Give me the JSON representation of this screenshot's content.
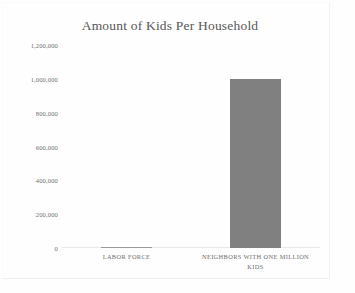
{
  "chart_data": {
    "type": "bar",
    "title": "Amount of Kids Per Household",
    "xlabel": "",
    "ylabel": "",
    "categories": [
      "LABOR FORCE",
      "NEIGHBORS WITH ONE MILLION KIDS"
    ],
    "values": [
      0,
      1000000
    ],
    "ylim": [
      0,
      1200000
    ],
    "yticks": [
      0,
      200000,
      400000,
      600000,
      800000,
      1000000,
      1200000
    ],
    "ytick_labels": [
      "0",
      "200,000",
      "400,000",
      "600,000",
      "800,000",
      "1,000,000",
      "1,200,000"
    ],
    "grid": false,
    "legend": false,
    "bar_color": "#808080",
    "title_color": "#585858",
    "tick_color": "#6e6e6e",
    "background_color": "#fefefe"
  }
}
